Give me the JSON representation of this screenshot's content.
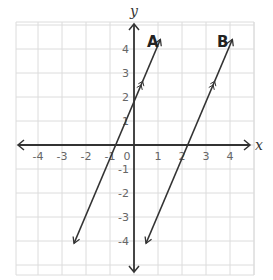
{
  "chart_data": {
    "type": "line",
    "title": "",
    "xlabel": "x",
    "ylabel": "y",
    "xlim": [
      -5,
      5
    ],
    "ylim": [
      -5,
      5
    ],
    "grid": true,
    "x_ticks": [
      "-4",
      "-3",
      "-2",
      "-1",
      "0",
      "1",
      "2",
      "3",
      "4"
    ],
    "y_ticks": [
      "4",
      "3",
      "2",
      "1",
      "-1",
      "-2",
      "-3",
      "-4"
    ],
    "series": [
      {
        "name": "A",
        "x": [
          -2.5,
          1.1
        ],
        "y": [
          -4.1,
          4.4
        ],
        "slope": 2.4,
        "y_intercept": 1.7,
        "x_intercept": -0.7
      },
      {
        "name": "B",
        "x": [
          0.5,
          4.1
        ],
        "y": [
          -4.1,
          4.4
        ],
        "slope": 2.4,
        "x_intercept": 2.3
      }
    ],
    "annotations": [
      "A",
      "B"
    ],
    "parallel_markers": true
  }
}
